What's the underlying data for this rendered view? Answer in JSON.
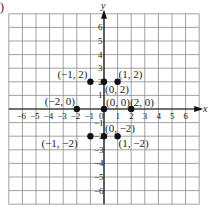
{
  "figure": {
    "part_marker": ")",
    "x_axis_label": "x",
    "y_axis_label": "y"
  },
  "chart_data": {
    "type": "scatter",
    "title": "",
    "xlabel": "x",
    "ylabel": "y",
    "xlim": [
      -7,
      7
    ],
    "ylim": [
      -7,
      7
    ],
    "grid": true,
    "x_ticks": [
      -6,
      -5,
      -4,
      -3,
      -2,
      -1,
      0,
      1,
      2,
      3,
      4,
      5,
      6
    ],
    "y_ticks": [
      -6,
      -5,
      -4,
      -3,
      -2,
      -1,
      1,
      2,
      3,
      4,
      5,
      6
    ],
    "points": [
      {
        "x": -1,
        "y": 2,
        "label": "(−1, 2)"
      },
      {
        "x": 0,
        "y": 2,
        "label": "(0, 2)"
      },
      {
        "x": 1,
        "y": 2,
        "label": "(1, 2)"
      },
      {
        "x": -2,
        "y": 0,
        "label": "(−2, 0)"
      },
      {
        "x": 0,
        "y": 0,
        "label": "(0, 0)"
      },
      {
        "x": 2,
        "y": 0,
        "label": "(2, 0)"
      },
      {
        "x": -1,
        "y": -2,
        "label": "(−1, −2)"
      },
      {
        "x": 0,
        "y": -2,
        "label": "(0, −2)"
      },
      {
        "x": 1,
        "y": -2,
        "label": "(1, −2)"
      }
    ]
  }
}
